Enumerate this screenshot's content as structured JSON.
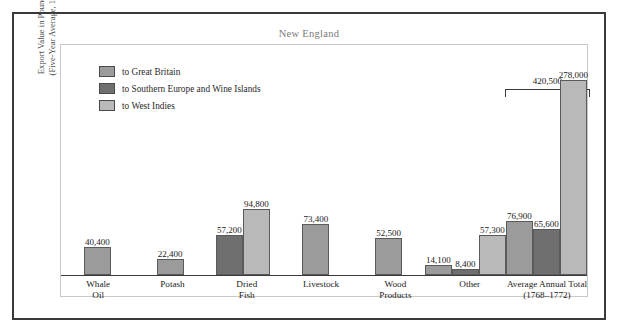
{
  "chart_data": {
    "type": "bar",
    "title": "New England",
    "xlabel": "",
    "ylabel": "Export Value in Pounds Sterling (Five-Year Average, 1768–1772)",
    "ylabel_line1": "Export Value in Pounds Sterling",
    "ylabel_line2": "(Five-Year Average, 1768–1772)",
    "ylim": [
      0,
      300000
    ],
    "grid": false,
    "legend_position": "top-left",
    "categories": [
      "Whale Oil",
      "Potash",
      "Dried Fish",
      "Livestock",
      "Wood Products",
      "Other",
      "Average Annual Total (1768–1772)"
    ],
    "category_lines": [
      [
        "Whale",
        "Oil"
      ],
      [
        "Potash"
      ],
      [
        "Dried",
        "Fish"
      ],
      [
        "Livestock"
      ],
      [
        "Wood",
        "Products"
      ],
      [
        "Other"
      ],
      [
        "Average Annual Total",
        "(1768–1772)"
      ]
    ],
    "series": [
      {
        "name": "to Great Britain",
        "color": "#9b9b9b",
        "values": [
          40400,
          22400,
          null,
          73400,
          52500,
          14100,
          76900
        ]
      },
      {
        "name": "to Southern Europe and Wine Islands",
        "color": "#6f6f6f",
        "values": [
          null,
          null,
          57200,
          null,
          null,
          8400,
          65600
        ]
      },
      {
        "name": "to West Indies",
        "color": "#b9b9b9",
        "values": [
          null,
          null,
          94800,
          null,
          null,
          57300,
          278000
        ]
      }
    ],
    "bars": [
      {
        "category": "Whale Oil",
        "series": "to Great Britain",
        "value": 40400,
        "label": "40,400"
      },
      {
        "category": "Potash",
        "series": "to Great Britain",
        "value": 22400,
        "label": "22,400"
      },
      {
        "category": "Dried Fish",
        "series": "to Southern Europe and Wine Islands",
        "value": 57200,
        "label": "57,200"
      },
      {
        "category": "Dried Fish",
        "series": "to West Indies",
        "value": 94800,
        "label": "94,800"
      },
      {
        "category": "Livestock",
        "series": "to Great Britain",
        "value": 73400,
        "label": "73,400"
      },
      {
        "category": "Wood Products",
        "series": "to Great Britain",
        "value": 52500,
        "label": "52,500"
      },
      {
        "category": "Other",
        "series": "to Great Britain",
        "value": 14100,
        "label": "14,100"
      },
      {
        "category": "Other",
        "series": "to Southern Europe and Wine Islands",
        "value": 8400,
        "label": "8,400"
      },
      {
        "category": "Other",
        "series": "to West Indies",
        "value": 57300,
        "label": "57,300"
      },
      {
        "category": "Average Annual Total (1768–1772)",
        "series": "to Great Britain",
        "value": 76900,
        "label": "76,900"
      },
      {
        "category": "Average Annual Total (1768–1772)",
        "series": "to Southern Europe and Wine Islands",
        "value": 65600,
        "label": "65,600"
      },
      {
        "category": "Average Annual Total (1768–1772)",
        "series": "to West Indies",
        "value": 278000,
        "label": "278,000"
      }
    ],
    "annotations": [
      {
        "type": "bracket",
        "label": "420,500",
        "value": 420500,
        "over_category": "Average Annual Total (1768–1772)",
        "description": "Sum of the three Average Annual Total bars"
      }
    ]
  },
  "legend": {
    "items": [
      {
        "label": "to Great Britain",
        "color": "#9b9b9b"
      },
      {
        "label": "to Southern Europe and Wine Islands",
        "color": "#6f6f6f"
      },
      {
        "label": "to West Indies",
        "color": "#b9b9b9"
      }
    ]
  }
}
